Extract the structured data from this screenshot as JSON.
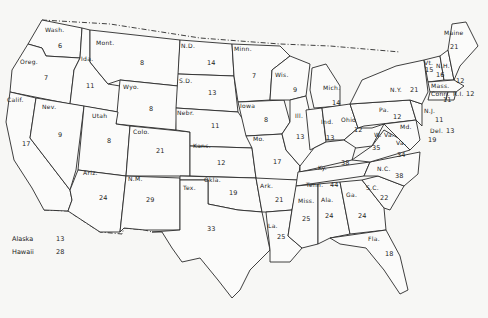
{
  "map": {
    "type": "US states choropleth-style labeled map",
    "states": [
      {
        "abbr": "Wash.",
        "value": "6"
      },
      {
        "abbr": "Oreg.",
        "value": "7"
      },
      {
        "abbr": "Calif.",
        "value": "17"
      },
      {
        "abbr": "Ida.",
        "value": "11"
      },
      {
        "abbr": "Nev.",
        "value": "9"
      },
      {
        "abbr": "Mont.",
        "value": "8"
      },
      {
        "abbr": "Wyo.",
        "value": "8"
      },
      {
        "abbr": "Utah",
        "value": "8"
      },
      {
        "abbr": "Colo.",
        "value": "21"
      },
      {
        "abbr": "Ariz.",
        "value": "24"
      },
      {
        "abbr": "N.M.",
        "value": "29"
      },
      {
        "abbr": "N.D.",
        "value": "14"
      },
      {
        "abbr": "S.D.",
        "value": "13"
      },
      {
        "abbr": "Nebr.",
        "value": "11"
      },
      {
        "abbr": "Kans.",
        "value": "12"
      },
      {
        "abbr": "Okla.",
        "value": "19"
      },
      {
        "abbr": "Tex.",
        "value": "33"
      },
      {
        "abbr": "Minn.",
        "value": "7"
      },
      {
        "abbr": "Iowa",
        "value": "8"
      },
      {
        "abbr": "Mo.",
        "value": "17"
      },
      {
        "abbr": "Ark.",
        "value": "21"
      },
      {
        "abbr": "La.",
        "value": "25"
      },
      {
        "abbr": "Wis.",
        "value": "9"
      },
      {
        "abbr": "Ill.",
        "value": "13"
      },
      {
        "abbr": "Mich.",
        "value": "14"
      },
      {
        "abbr": "Ind.",
        "value": "13"
      },
      {
        "abbr": "Ohio",
        "value": "12"
      },
      {
        "abbr": "Ky.",
        "value": "38"
      },
      {
        "abbr": "Tenn.",
        "value": "44"
      },
      {
        "abbr": "Miss.",
        "value": "25"
      },
      {
        "abbr": "Ala.",
        "value": "24"
      },
      {
        "abbr": "Ga.",
        "value": "24"
      },
      {
        "abbr": "Fla.",
        "value": "18"
      },
      {
        "abbr": "S.C.",
        "value": "22"
      },
      {
        "abbr": "N.C.",
        "value": "38"
      },
      {
        "abbr": "Va.",
        "value": "34"
      },
      {
        "abbr": "W. Va.",
        "value": "35"
      },
      {
        "abbr": "Md.",
        "value": "19"
      },
      {
        "abbr": "Del.",
        "value": "13"
      },
      {
        "abbr": "Pa.",
        "value": "12"
      },
      {
        "abbr": "N.J.",
        "value": "11"
      },
      {
        "abbr": "N.Y.",
        "value": "21"
      },
      {
        "abbr": "Vt.",
        "value": "15"
      },
      {
        "abbr": "N.H.",
        "value": "16"
      },
      {
        "abbr": "Maine",
        "value": "21"
      },
      {
        "abbr": "Mass.",
        "value": "12"
      },
      {
        "abbr": "Conn.",
        "value": "11"
      },
      {
        "abbr": "R.I.",
        "value": "12"
      }
    ],
    "legend": [
      {
        "name": "Alaska",
        "value": "13"
      },
      {
        "name": "Hawaii",
        "value": "28"
      }
    ]
  }
}
